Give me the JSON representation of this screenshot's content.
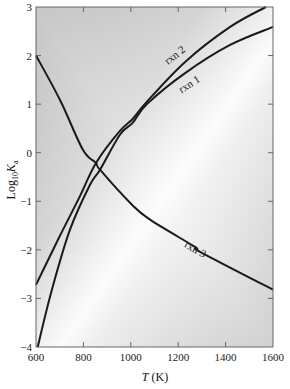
{
  "chart_data": {
    "type": "line",
    "title": "",
    "xlabel_italic": "T",
    "xlabel_rest": " (K)",
    "ylabel_main": "Log",
    "ylabel_sub1": "10",
    "ylabel_var": "K",
    "ylabel_sub2": "a",
    "xlim": [
      600,
      1600
    ],
    "ylim": [
      -4,
      3
    ],
    "xticks": [
      600,
      800,
      1000,
      1200,
      1400,
      1600
    ],
    "yticks": [
      3,
      2,
      1,
      0,
      -1,
      -2,
      -3,
      -4
    ],
    "xtick_labels": [
      "600",
      "800",
      "1000",
      "1200",
      "1400",
      "1600"
    ],
    "ytick_labels": [
      "3",
      "2",
      "1",
      "0",
      "−1",
      "−2",
      "−3",
      "−4"
    ],
    "grid": false,
    "series": [
      {
        "name": "rxn 1",
        "label": "rxn 1",
        "x": [
          607,
          667,
          743,
          828,
          870,
          954,
          1009,
          1068,
          1229,
          1419,
          1600
        ],
        "y": [
          -4.0,
          -2.82,
          -1.59,
          -0.66,
          -0.35,
          0.37,
          0.62,
          1.0,
          1.64,
          2.22,
          2.59
        ]
      },
      {
        "name": "rxn 2",
        "label": "rxn 2",
        "x": [
          600,
          701,
          786,
          853,
          954,
          1009,
          1068,
          1229,
          1419,
          1570
        ],
        "y": [
          -2.72,
          -1.71,
          -0.89,
          -0.21,
          0.45,
          0.7,
          1.05,
          1.87,
          2.59,
          3.0
        ]
      },
      {
        "name": "rxn 3",
        "label": "rxn 3",
        "x": [
          600,
          701,
          798,
          853,
          870,
          1001,
          1081,
          1271,
          1292,
          1600
        ],
        "y": [
          2.0,
          1.09,
          0.06,
          -0.21,
          -0.35,
          -1.05,
          -1.38,
          -1.94,
          -2.04,
          -2.82
        ]
      }
    ],
    "annotations": [
      {
        "text": "rxn 2",
        "series": "rxn 2",
        "x": 1195,
        "y": 1.95,
        "angle": -38
      },
      {
        "text": "rxn 1",
        "series": "rxn 1",
        "x": 1255,
        "y": 1.35,
        "angle": -33
      },
      {
        "text": "rxn 3",
        "series": "rxn 3",
        "x": 1265,
        "y": -2.05,
        "angle": 30
      }
    ]
  }
}
